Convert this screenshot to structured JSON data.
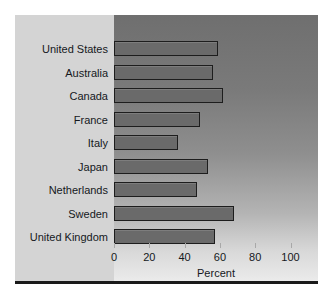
{
  "chart_data": {
    "type": "bar",
    "orientation": "horizontal",
    "title": "",
    "xlabel": "Percent",
    "ylabel": "",
    "xlim": [
      0,
      110
    ],
    "xticks": [
      0,
      20,
      40,
      60,
      80,
      100
    ],
    "xtick_labels": [
      "0",
      "20",
      "40",
      "60",
      "80",
      "100"
    ],
    "grid": false,
    "legend": null,
    "categories": [
      "United States",
      "Australia",
      "Canada",
      "France",
      "Italy",
      "Japan",
      "Netherlands",
      "Sweden",
      "United Kingdom"
    ],
    "values": [
      59,
      56,
      62,
      49,
      36,
      53,
      47,
      68,
      57
    ],
    "bars": [
      {
        "label": "United States",
        "value": 59
      },
      {
        "label": "Australia",
        "value": 56
      },
      {
        "label": "Canada",
        "value": 62
      },
      {
        "label": "France",
        "value": 49
      },
      {
        "label": "Italy",
        "value": 36
      },
      {
        "label": "Japan",
        "value": 53
      },
      {
        "label": "Netherlands",
        "value": 47
      },
      {
        "label": "Sweden",
        "value": 68
      },
      {
        "label": "United Kingdom",
        "value": 57
      }
    ],
    "colors": {
      "bar_fill": "#6a6a6a",
      "bar_edge": "#1d1d1d",
      "panel_background": "#d4d4d4",
      "plot_gradient_top": "#6f6f6f",
      "plot_gradient_bottom": "#ececec",
      "text": "#15181c",
      "baseline_rule": "#1a1a1a"
    }
  }
}
